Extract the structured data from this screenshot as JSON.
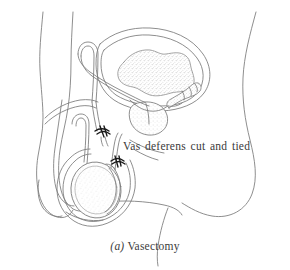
{
  "figure": {
    "kind": "anatomical-line-drawing",
    "background_color": "#ffffff",
    "line_color": "#7a7a7a",
    "dark_accent_color": "#1a1a1a",
    "text_color": "#3a3a3a",
    "stipple_color": "#b9b9b9"
  },
  "annotations": [
    {
      "id": "vas-deferens-label",
      "text": "Vas deferens cut and tied"
    }
  ],
  "caption": {
    "index": "(a)",
    "text": "Vasectomy",
    "full": "(a) Vasectomy"
  },
  "structures": [
    {
      "name": "body-outline-anterior",
      "label": "Body outline (anterior, left)"
    },
    {
      "name": "buttock-outline",
      "label": "Buttock outline (posterior, right)"
    },
    {
      "name": "gluteal-fold",
      "label": "Gluteal fold"
    },
    {
      "name": "bladder",
      "label": "Bladder"
    },
    {
      "name": "bladder-lumen-stipple",
      "label": "Bladder interior (stippled)"
    },
    {
      "name": "prostate",
      "label": "Prostate gland"
    },
    {
      "name": "seminal-vesicle",
      "label": "Seminal vesicle"
    },
    {
      "name": "urethra",
      "label": "Urethra"
    },
    {
      "name": "penis",
      "label": "Penis"
    },
    {
      "name": "vas-deferens",
      "label": "Vas deferens"
    },
    {
      "name": "vas-deferens-tie-upper",
      "label": "Upper ligature (tie)"
    },
    {
      "name": "vas-deferens-tie-lower",
      "label": "Lower ligature (tie)"
    },
    {
      "name": "testis",
      "label": "Testis"
    },
    {
      "name": "epididymis",
      "label": "Epididymis"
    },
    {
      "name": "scrotum",
      "label": "Scrotum"
    }
  ]
}
